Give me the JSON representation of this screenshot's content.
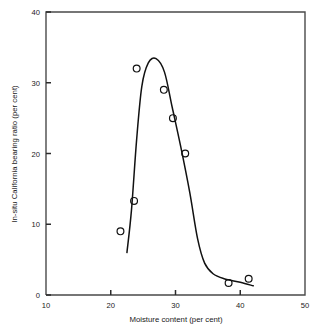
{
  "chart_data": {
    "type": "scatter",
    "title": "",
    "subtitle": "",
    "xlabel": "Moisture content (per cent)",
    "ylabel": "In-situ California bearing ratio (per cent)",
    "xlim": [
      10,
      50
    ],
    "ylim": [
      0,
      40
    ],
    "xticks": [
      10,
      20,
      30,
      40,
      50
    ],
    "yticks": [
      0,
      10,
      20,
      30,
      40
    ],
    "xtick_labels": [
      "10",
      "20",
      "30",
      "40",
      "50"
    ],
    "ytick_labels": [
      "0",
      "10",
      "20",
      "30",
      "40"
    ],
    "grid": false,
    "legend": null,
    "legend_position": "none",
    "marker": "open-circle",
    "points": [
      {
        "x": 21.5,
        "y": 9.0
      },
      {
        "x": 23.6,
        "y": 13.3
      },
      {
        "x": 24.0,
        "y": 32.0
      },
      {
        "x": 28.2,
        "y": 29.0
      },
      {
        "x": 29.6,
        "y": 25.0
      },
      {
        "x": 31.5,
        "y": 20.0
      },
      {
        "x": 38.2,
        "y": 1.7
      },
      {
        "x": 41.3,
        "y": 2.3
      }
    ],
    "fitted_curve": [
      {
        "x": 22.5,
        "y": 6.0
      },
      {
        "x": 23.2,
        "y": 12.0
      },
      {
        "x": 24.0,
        "y": 22.0
      },
      {
        "x": 24.8,
        "y": 29.5
      },
      {
        "x": 25.8,
        "y": 32.8
      },
      {
        "x": 27.0,
        "y": 33.4
      },
      {
        "x": 28.3,
        "y": 31.5
      },
      {
        "x": 29.5,
        "y": 26.5
      },
      {
        "x": 30.8,
        "y": 21.0
      },
      {
        "x": 32.2,
        "y": 14.5
      },
      {
        "x": 33.4,
        "y": 8.0
      },
      {
        "x": 34.5,
        "y": 4.5
      },
      {
        "x": 35.8,
        "y": 3.0
      },
      {
        "x": 37.5,
        "y": 2.3
      },
      {
        "x": 40.0,
        "y": 1.8
      },
      {
        "x": 42.0,
        "y": 1.3
      }
    ]
  }
}
